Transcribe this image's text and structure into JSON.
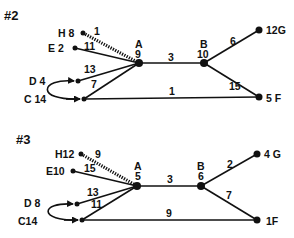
{
  "diagrams": [
    {
      "title": "#2",
      "nodes": {
        "H": {
          "label": "H 8",
          "x": 83,
          "y": 33,
          "r": 2.5
        },
        "E": {
          "label": "E 2",
          "x": 75,
          "y": 48,
          "r": 2.5
        },
        "D": {
          "label": "D 4",
          "x": 78,
          "y": 81,
          "r": 2.5
        },
        "C": {
          "label": "C 14",
          "x": 84,
          "y": 99,
          "r": 2.5
        },
        "A": {
          "label": "A",
          "sub": "9",
          "x": 139,
          "y": 63,
          "r": 4
        },
        "B": {
          "label": "B",
          "sub": "10",
          "x": 204,
          "y": 63,
          "r": 4
        },
        "G": {
          "label": "12G",
          "x": 259,
          "y": 30,
          "r": 3.5
        },
        "F": {
          "label": "5 F",
          "x": 259,
          "y": 97,
          "r": 3.5
        }
      },
      "edges": [
        {
          "from": "H",
          "to": "A",
          "weight": "1",
          "style": "hatched"
        },
        {
          "from": "E",
          "to": "A",
          "weight": "11"
        },
        {
          "from": "D",
          "to": "A",
          "weight": "13"
        },
        {
          "from": "C",
          "to": "A",
          "weight": "7"
        },
        {
          "from": "A",
          "to": "B",
          "weight": "3"
        },
        {
          "from": "B",
          "to": "G",
          "weight": "6"
        },
        {
          "from": "B",
          "to": "F",
          "weight": "15"
        },
        {
          "from": "C",
          "to": "F",
          "weight": "1"
        },
        {
          "from": "C",
          "to": "D",
          "weight": "",
          "style": "curved-arrow"
        }
      ]
    },
    {
      "title": "#3",
      "nodes": {
        "H": {
          "label": "H12",
          "x": 81,
          "y": 154,
          "r": 2.5
        },
        "E": {
          "label": "E10",
          "x": 73,
          "y": 171,
          "r": 2.5
        },
        "D": {
          "label": "D 8",
          "x": 77,
          "y": 204,
          "r": 2.5
        },
        "C": {
          "label": "C14",
          "x": 82,
          "y": 220,
          "r": 2.5
        },
        "A": {
          "label": "A",
          "sub": "5",
          "x": 137,
          "y": 186,
          "r": 4
        },
        "B": {
          "label": "B",
          "sub": "6",
          "x": 201,
          "y": 186,
          "r": 4
        },
        "G": {
          "label": "4 G",
          "x": 257,
          "y": 154,
          "r": 3.5
        },
        "F": {
          "label": "1F",
          "x": 257,
          "y": 220,
          "r": 3.5
        }
      },
      "edges": [
        {
          "from": "H",
          "to": "A",
          "weight": "9",
          "style": "hatched"
        },
        {
          "from": "E",
          "to": "A",
          "weight": "15"
        },
        {
          "from": "D",
          "to": "A",
          "weight": "13"
        },
        {
          "from": "C",
          "to": "A",
          "weight": "11"
        },
        {
          "from": "A",
          "to": "B",
          "weight": "3"
        },
        {
          "from": "B",
          "to": "G",
          "weight": "2"
        },
        {
          "from": "B",
          "to": "F",
          "weight": "7"
        },
        {
          "from": "C",
          "to": "F",
          "weight": "9"
        },
        {
          "from": "C",
          "to": "D",
          "weight": "",
          "style": "curved-arrow"
        }
      ]
    }
  ],
  "text": {
    "d2_title": "#2",
    "d2_H": "H 8",
    "d2_E": "E 2",
    "d2_D": "D 4",
    "d2_C": "C 14",
    "d2_A": "A",
    "d2_A_val": "9",
    "d2_B": "B",
    "d2_B_val": "10",
    "d2_G": "12G",
    "d2_F": "5 F",
    "d2_w_HA": "1",
    "d2_w_EA": "11",
    "d2_w_DA": "13",
    "d2_w_CA": "7",
    "d2_w_AB": "3",
    "d2_w_BG": "6",
    "d2_w_BF": "15",
    "d2_w_CF": "1",
    "d3_title": "#3",
    "d3_H": "H12",
    "d3_E": "E10",
    "d3_D": "D 8",
    "d3_C": "C14",
    "d3_A": "A",
    "d3_A_val": "5",
    "d3_B": "B",
    "d3_B_val": "6",
    "d3_G": "4 G",
    "d3_F": "1F",
    "d3_w_HA": "9",
    "d3_w_EA": "15",
    "d3_w_DA": "13",
    "d3_w_CA": "11",
    "d3_w_AB": "3",
    "d3_w_BG": "2",
    "d3_w_BF": "7",
    "d3_w_CF": "9"
  }
}
